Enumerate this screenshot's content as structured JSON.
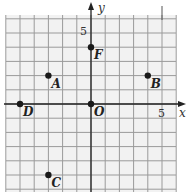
{
  "chart_data": {
    "type": "scatter",
    "title": "",
    "xlabel": "x",
    "ylabel": "y",
    "origin_label": "O",
    "xlim": [
      -6,
      6
    ],
    "ylim": [
      -6,
      6
    ],
    "grid": true,
    "tick_labels": {
      "x": [
        {
          "value": 5,
          "label": "5"
        }
      ],
      "y": [
        {
          "value": 5,
          "label": "5"
        }
      ]
    },
    "points": [
      {
        "label": "A",
        "x": -3,
        "y": 2
      },
      {
        "label": "B",
        "x": 4,
        "y": 2
      },
      {
        "label": "C",
        "x": -3,
        "y": -5
      },
      {
        "label": "D",
        "x": -5,
        "y": 0
      },
      {
        "label": "F",
        "x": 0,
        "y": 4
      },
      {
        "label": "O",
        "x": 0,
        "y": 0
      }
    ]
  },
  "colors": {
    "grid": "#9a9a9a",
    "background": "#f2f2f2",
    "axis": "#222222",
    "point": "#1a1a1a"
  }
}
